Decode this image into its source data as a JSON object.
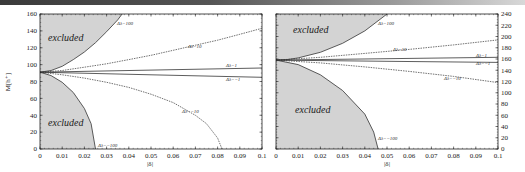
{
  "chart_data": [
    {
      "type": "line",
      "title": "",
      "xlabel": "|δ|",
      "ylabel": "M[h⁺]",
      "xlim": [
        0,
        0.1
      ],
      "ylim": [
        0,
        160
      ],
      "x_ticks": [
        "0",
        "0.01",
        "0.02",
        "0.03",
        "0.04",
        "0.05",
        "0.06",
        "0.07",
        "0.08",
        "0.09",
        "0.1"
      ],
      "y_ticks": [
        "0",
        "20",
        "40",
        "60",
        "80",
        "100",
        "120",
        "140",
        "160"
      ],
      "y_axis_side": "left",
      "grid": false,
      "origin_value": 91,
      "series": [
        {
          "name": "Δλ=100",
          "style": "solid",
          "x": [
            0,
            0.005,
            0.01,
            0.015,
            0.02,
            0.025,
            0.03,
            0.035,
            0.037
          ],
          "y": [
            91,
            93,
            98,
            106,
            115,
            126,
            139,
            153,
            160
          ]
        },
        {
          "name": "Δλ=10",
          "style": "dashed",
          "x": [
            0,
            0.01,
            0.02,
            0.03,
            0.04,
            0.05,
            0.06,
            0.07,
            0.08,
            0.09,
            0.1
          ],
          "y": [
            91,
            93,
            97,
            101,
            106,
            111,
            117,
            123,
            129,
            136,
            143
          ]
        },
        {
          "name": "Δλ=1",
          "style": "solid",
          "x": [
            0,
            0.05,
            0.1
          ],
          "y": [
            91,
            93.5,
            96
          ]
        },
        {
          "name": "Δλ=-1",
          "style": "solid",
          "x": [
            0,
            0.05,
            0.1
          ],
          "y": [
            91,
            88,
            85
          ]
        },
        {
          "name": "Δλ=-10",
          "style": "dashed",
          "x": [
            0,
            0.01,
            0.02,
            0.03,
            0.04,
            0.05,
            0.06,
            0.07,
            0.075,
            0.08,
            0.082
          ],
          "y": [
            91,
            88,
            84,
            79,
            73,
            65,
            55,
            40,
            30,
            13,
            0
          ]
        },
        {
          "name": "Δλ=-100",
          "style": "solid",
          "x": [
            0,
            0.005,
            0.01,
            0.015,
            0.02,
            0.023,
            0.025
          ],
          "y": [
            91,
            87,
            79,
            67,
            48,
            30,
            0
          ]
        }
      ],
      "regions": [
        {
          "label": "excluded",
          "position": "upper-left"
        },
        {
          "label": "excluded",
          "position": "lower-left"
        }
      ],
      "annotations": [
        "Δλ=100",
        "Δλ=10",
        "Δλ=1",
        "Δλ=-1",
        "Δλ=-10",
        "Δλ=-100"
      ]
    },
    {
      "type": "line",
      "title": "",
      "xlabel": "|δ|",
      "ylabel": "",
      "xlim": [
        0,
        0.1
      ],
      "ylim": [
        0,
        240
      ],
      "x_ticks": [
        "0",
        "0.01",
        "0.02",
        "0.03",
        "0.04",
        "0.05",
        "0.06",
        "0.07",
        "0.08",
        "0.09",
        "0.1"
      ],
      "y_ticks": [
        "0",
        "20",
        "40",
        "60",
        "80",
        "100",
        "120",
        "140",
        "160",
        "180",
        "200",
        "220",
        "240"
      ],
      "y_axis_side": "right",
      "grid": false,
      "origin_value": 158,
      "series": [
        {
          "name": "Δλ=100",
          "style": "solid",
          "x": [
            0,
            0.005,
            0.01,
            0.02,
            0.03,
            0.04,
            0.05
          ],
          "y": [
            158,
            159,
            162,
            172,
            188,
            210,
            240
          ]
        },
        {
          "name": "Δλ=10",
          "style": "dashed",
          "x": [
            0,
            0.02,
            0.04,
            0.06,
            0.08,
            0.1
          ],
          "y": [
            158,
            163,
            170,
            177,
            185,
            194
          ]
        },
        {
          "name": "Δλ=1",
          "style": "solid",
          "x": [
            0,
            0.05,
            0.1
          ],
          "y": [
            158,
            160.5,
            163
          ]
        },
        {
          "name": "Δλ=-1",
          "style": "solid",
          "x": [
            0,
            0.05,
            0.1
          ],
          "y": [
            158,
            156,
            154
          ]
        },
        {
          "name": "Δλ=-10",
          "style": "dashed",
          "x": [
            0,
            0.02,
            0.04,
            0.06,
            0.08,
            0.1
          ],
          "y": [
            158,
            153,
            146,
            138,
            129,
            118
          ]
        },
        {
          "name": "Δλ=-100",
          "style": "solid",
          "x": [
            0,
            0.01,
            0.02,
            0.03,
            0.04,
            0.044,
            0.046
          ],
          "y": [
            158,
            150,
            132,
            104,
            62,
            30,
            0
          ]
        }
      ],
      "regions": [
        {
          "label": "excluded",
          "position": "upper-left"
        },
        {
          "label": "excluded",
          "position": "lower-left"
        }
      ],
      "annotations": [
        "Δλ=100",
        "Δλ=10",
        "Δλ=1",
        "Δλ=-1",
        "Δλ=-10",
        "Δλ=-100"
      ]
    }
  ],
  "labels": {
    "excluded": "excluded",
    "xlabel": "|δ|",
    "ylabel": "M[h⁺]",
    "d100": "Δλ=100",
    "d10": "Δλ=10",
    "d1": "Δλ=1",
    "dm1": "Δλ=−1",
    "dm10": "Δλ=−10",
    "dm100": "Δλ=−100"
  }
}
